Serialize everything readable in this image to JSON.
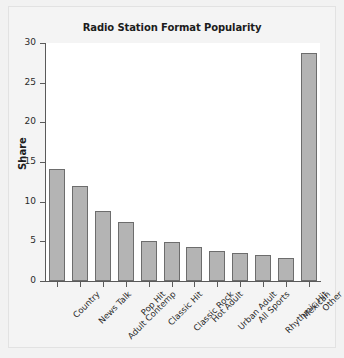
{
  "chart_data": {
    "type": "bar",
    "title": "Radio Station Format Popularity",
    "xlabel": "",
    "ylabel": "Share",
    "categories": [
      "Country",
      "News Talk",
      "Adult Contemp",
      "Pop Hit",
      "Classic Hit",
      "Classic Rock",
      "Hot Adult",
      "Urban Adult",
      "All Sports",
      "Rhythmic Hit",
      "Mexican",
      "Other"
    ],
    "values": [
      14.1,
      12.0,
      8.8,
      7.5,
      5.1,
      4.9,
      4.3,
      3.8,
      3.5,
      3.3,
      2.9,
      28.7
    ],
    "ylim": [
      0,
      30
    ],
    "yticks": [
      0,
      5,
      10,
      15,
      20,
      25,
      30
    ],
    "ytick_labels": [
      "0",
      "5",
      "10",
      "15",
      "20",
      "25",
      "30"
    ],
    "grid": false,
    "legend": null,
    "bar_color": "#b4b4b4",
    "bar_edge_color": "#6d6d6d",
    "plot_background": "#ffffff",
    "figure_background": "#f2f2f2"
  }
}
